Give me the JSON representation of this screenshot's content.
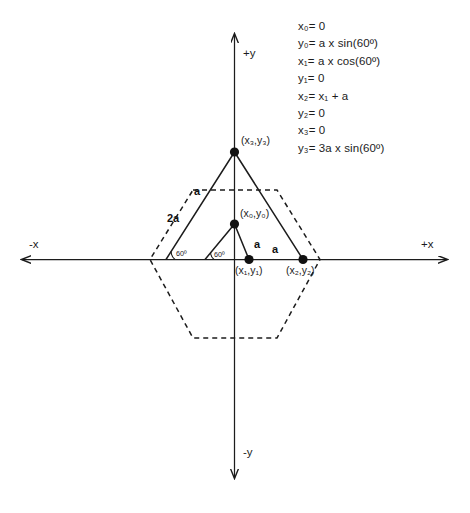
{
  "equations": [
    {
      "id": "eq-x0",
      "text": "x₀= 0"
    },
    {
      "id": "eq-y0",
      "text": "y₀= a x sin(60º)"
    },
    {
      "id": "eq-x1",
      "text": "x₁= a x cos(60º)"
    },
    {
      "id": "eq-y1",
      "text": "y₁= 0"
    },
    {
      "id": "eq-x2",
      "text": "x₂= x₁ + a"
    },
    {
      "id": "eq-y2",
      "text": "y₂= 0"
    },
    {
      "id": "eq-x3",
      "text": "x₃= 0"
    },
    {
      "id": "eq-y3",
      "text": "y₃= 3a x sin(60º)"
    }
  ],
  "axes": {
    "x_negative": "-x",
    "x_positive": "+x",
    "y_positive": "+y",
    "y_negative": "-y"
  },
  "points": [
    {
      "id": "p3",
      "label": "(x₃,y₃)"
    },
    {
      "id": "p0",
      "label": "(x₀,y₀)"
    },
    {
      "id": "p1",
      "label": "(x₁,y₁)"
    },
    {
      "id": "p2",
      "label": "(x₂,y₂)"
    }
  ],
  "segment_labels": {
    "upper_left_a": "a",
    "outer_left_2a": "2a",
    "inner_right_a": "a",
    "base_a": "a"
  },
  "angles": {
    "outer_left": "60º",
    "inner_left": "60º"
  },
  "colors": {
    "stroke": "#1c1c1c",
    "text": "#1c1c1c",
    "background": "#ffffff"
  }
}
